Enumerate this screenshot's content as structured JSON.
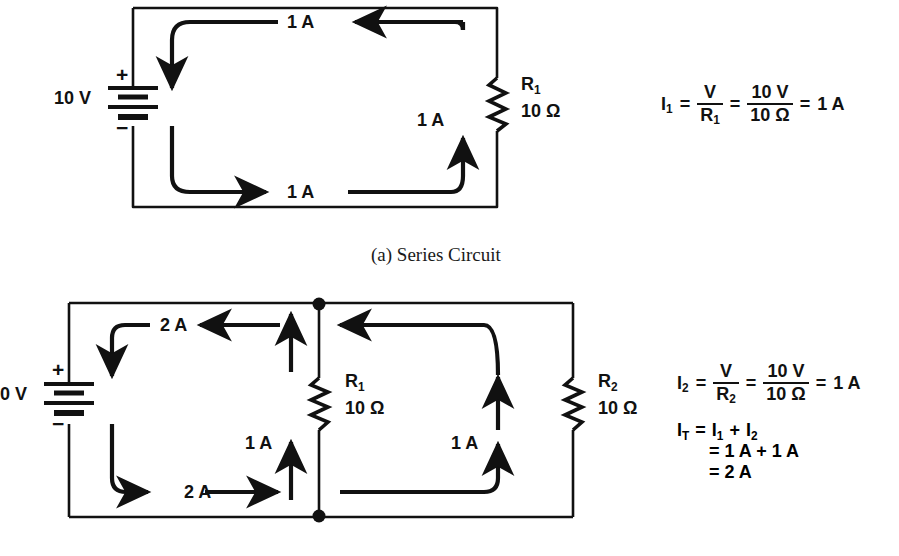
{
  "figure": {
    "title_a": "(a) Series Circuit",
    "background": "#ffffff",
    "ink": "#111111"
  },
  "circuit_a": {
    "name": "Series Circuit",
    "source": {
      "label": "10 V",
      "plus": "+",
      "minus": "−"
    },
    "resistor": {
      "ref": "R",
      "sub": "1",
      "value": "10 Ω"
    },
    "current_labels": [
      {
        "text": "1 A",
        "position": "top"
      },
      {
        "text": "1 A",
        "position": "right"
      },
      {
        "text": "1 A",
        "position": "bottom"
      }
    ],
    "equation": {
      "lhs": "I",
      "lhs_sub": "1",
      "eq1": "=",
      "frac1_num": "V",
      "frac1_den": "R",
      "frac1_den_sub": "1",
      "eq2": "=",
      "frac2_num": "10 V",
      "frac2_den": "10 Ω",
      "eq3": "=",
      "result": "1 A"
    }
  },
  "circuit_b": {
    "name": "Parallel Circuit",
    "source": {
      "label": "10 V",
      "plus": "+",
      "minus": "−"
    },
    "resistor_1": {
      "ref": "R",
      "sub": "1",
      "value": "10 Ω"
    },
    "resistor_2": {
      "ref": "R",
      "sub": "2",
      "value": "10 Ω"
    },
    "current_labels": [
      {
        "text": "2 A",
        "position": "top-left"
      },
      {
        "text": "2 A",
        "position": "bottom-left"
      },
      {
        "text": "1 A",
        "position": "middle-branch"
      },
      {
        "text": "1 A",
        "position": "right-branch"
      }
    ],
    "equation_i2": {
      "lhs": "I",
      "lhs_sub": "2",
      "eq1": "=",
      "frac1_num": "V",
      "frac1_den": "R",
      "frac1_den_sub": "2",
      "eq2": "=",
      "frac2_num": "10 V",
      "frac2_den": "10 Ω",
      "eq3": "=",
      "result": "1 A"
    },
    "equation_it": {
      "lhs": "I",
      "lhs_sub": "T",
      "line1_eq": "=",
      "line1_a": "I",
      "line1_a_sub": "1",
      "line1_plus": "+",
      "line1_b": "I",
      "line1_b_sub": "2",
      "line2": "= 1 A + 1 A",
      "line3": "= 2 A"
    }
  }
}
